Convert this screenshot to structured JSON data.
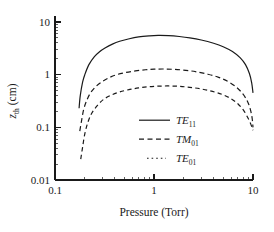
{
  "chart_data": {
    "type": "line",
    "title": "",
    "xlabel": "Pressure (Torr)",
    "ylabel": "z_th (cm)",
    "ylabel_base": "z",
    "ylabel_sub": "th",
    "ylabel_unit": " (cm)",
    "xscale": "log",
    "yscale": "log",
    "xlim": [
      0.1,
      10
    ],
    "ylim": [
      0.01,
      10
    ],
    "grid": false,
    "xticks": [
      "0.1",
      "1",
      "10"
    ],
    "xtick_values": [
      0.1,
      1,
      10
    ],
    "yticks": [
      "0.01",
      "0.1",
      "1",
      "10"
    ],
    "ytick_values": [
      0.01,
      0.1,
      1,
      10
    ],
    "legend_position": "center-right-inside",
    "series": [
      {
        "name": "TE_11",
        "label_base": "TE",
        "label_sub": "11",
        "style": "solid",
        "x": [
          0.175,
          0.18,
          0.19,
          0.2,
          0.22,
          0.25,
          0.28,
          0.32,
          0.38,
          0.45,
          0.55,
          0.7,
          0.9,
          1.1,
          1.4,
          1.8,
          2.3,
          3.0,
          4.0,
          5.0,
          6.2,
          7.4,
          8.4,
          9.2,
          9.7,
          10.0
        ],
        "y": [
          0.23,
          0.4,
          0.72,
          1.0,
          1.55,
          2.2,
          2.7,
          3.2,
          3.8,
          4.3,
          4.75,
          5.2,
          5.45,
          5.55,
          5.5,
          5.3,
          5.0,
          4.55,
          3.95,
          3.4,
          2.75,
          2.1,
          1.55,
          1.05,
          0.7,
          0.45
        ]
      },
      {
        "name": "TM_01",
        "label_base": "TM",
        "label_sub": "01",
        "style": "dashed",
        "x": [
          0.178,
          0.185,
          0.195,
          0.21,
          0.23,
          0.26,
          0.3,
          0.35,
          0.42,
          0.52,
          0.65,
          0.82,
          1.0,
          1.25,
          1.6,
          2.1,
          2.7,
          3.5,
          4.5,
          5.6,
          6.8,
          7.9,
          8.8,
          9.4,
          9.8,
          10.0
        ],
        "y": [
          0.085,
          0.13,
          0.22,
          0.33,
          0.46,
          0.6,
          0.74,
          0.87,
          1.0,
          1.1,
          1.18,
          1.24,
          1.27,
          1.28,
          1.26,
          1.21,
          1.13,
          1.02,
          0.89,
          0.74,
          0.58,
          0.43,
          0.31,
          0.22,
          0.15,
          0.1
        ]
      },
      {
        "name": "TE_01",
        "label_base": "TE",
        "label_sub": "01",
        "style": "dotted",
        "x": [
          0.182,
          0.19,
          0.2,
          0.215,
          0.235,
          0.27,
          0.31,
          0.37,
          0.45,
          0.56,
          0.7,
          0.88,
          1.1,
          1.4,
          1.8,
          2.3,
          3.0,
          3.9,
          4.9,
          6.0,
          7.1,
          8.1,
          8.9,
          9.5,
          9.85,
          10.0
        ],
        "y": [
          0.025,
          0.042,
          0.075,
          0.125,
          0.185,
          0.265,
          0.34,
          0.41,
          0.47,
          0.52,
          0.56,
          0.59,
          0.605,
          0.61,
          0.6,
          0.575,
          0.535,
          0.48,
          0.42,
          0.35,
          0.275,
          0.205,
          0.15,
          0.115,
          0.095,
          0.088
        ]
      }
    ]
  },
  "plot_area": {
    "left": 55,
    "right": 253,
    "top": 22,
    "bottom": 180
  }
}
